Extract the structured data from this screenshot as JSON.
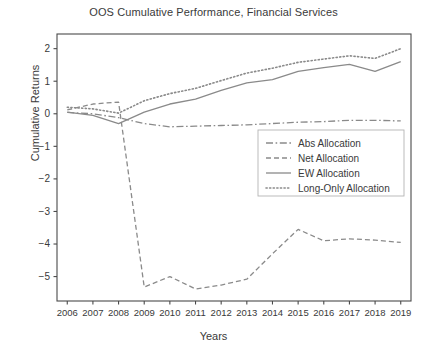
{
  "chart_data": {
    "type": "line",
    "title": "OOS Cumulative Performance, Financial Services",
    "xlabel": "Years",
    "ylabel": "Cumulative Returns",
    "x": [
      2006,
      2007,
      2008,
      2009,
      2010,
      2011,
      2012,
      2013,
      2014,
      2015,
      2016,
      2017,
      2018,
      2019
    ],
    "xticklabels": [
      "2006",
      "2007",
      "2008",
      "2009",
      "2010",
      "2011",
      "2012",
      "2013",
      "2014",
      "2015",
      "2016",
      "2017",
      "2018",
      "2019"
    ],
    "yticklabels": [
      "2",
      "1",
      "0",
      "−1",
      "−2",
      "−3",
      "−4",
      "−5"
    ],
    "yticks": [
      2,
      1,
      0,
      -1,
      -2,
      -3,
      -4,
      -5
    ],
    "xlim": [
      2005.6,
      2019.4
    ],
    "ylim": [
      -5.75,
      2.45
    ],
    "grid": false,
    "legend_position": "center-right",
    "line_color": "#8a8a8a",
    "axis_color": "#4a4a4a",
    "series": [
      {
        "name": "Abs Allocation",
        "dash": "dashdot",
        "values": [
          0.04,
          0.0,
          -0.12,
          -0.3,
          -0.4,
          -0.38,
          -0.36,
          -0.34,
          -0.3,
          -0.26,
          -0.24,
          -0.2,
          -0.2,
          -0.22
        ]
      },
      {
        "name": "Net Allocation",
        "dash": "dashed",
        "values": [
          0.12,
          0.3,
          0.36,
          -5.32,
          -5.0,
          -5.38,
          -5.26,
          -5.08,
          -4.3,
          -3.55,
          -3.9,
          -3.84,
          -3.88,
          -3.95
        ]
      },
      {
        "name": "EW Allocation",
        "dash": "solid",
        "values": [
          0.05,
          -0.05,
          -0.3,
          0.05,
          0.3,
          0.45,
          0.72,
          0.95,
          1.05,
          1.3,
          1.42,
          1.52,
          1.3,
          1.6
        ]
      },
      {
        "name": "Long-Only Allocation",
        "dash": "dotted",
        "values": [
          0.2,
          0.15,
          0.02,
          0.4,
          0.62,
          0.78,
          1.02,
          1.25,
          1.4,
          1.58,
          1.68,
          1.78,
          1.7,
          2.0
        ]
      }
    ]
  }
}
